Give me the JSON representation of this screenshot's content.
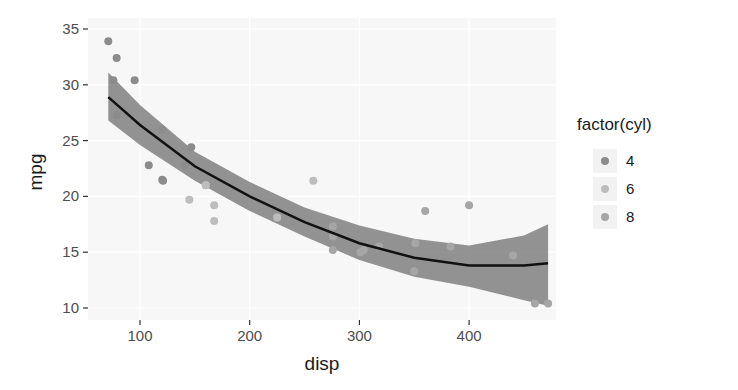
{
  "chart_data": {
    "type": "scatter",
    "title": "",
    "xlabel": "disp",
    "ylabel": "mpg",
    "xlim": [
      52,
      478
    ],
    "ylim": [
      9.1,
      35.5
    ],
    "x_ticks": [
      100,
      200,
      300,
      400
    ],
    "y_ticks": [
      10,
      15,
      20,
      25,
      30,
      35
    ],
    "grid": true,
    "legend": {
      "title": "factor(cyl)",
      "position": "right",
      "entries": [
        {
          "label": "4",
          "color": "#8c8c8c"
        },
        {
          "label": "6",
          "color": "#bdbdbd"
        },
        {
          "label": "8",
          "color": "#a6a6a6"
        }
      ]
    },
    "series": [
      {
        "name": "4",
        "color": "#8c8c8c",
        "points": [
          [
            71.1,
            33.9
          ],
          [
            78.7,
            32.4
          ],
          [
            75.7,
            30.4
          ],
          [
            95.1,
            30.4
          ],
          [
            108.0,
            22.8
          ],
          [
            120.3,
            21.5
          ],
          [
            140.8,
            22.8
          ],
          [
            146.7,
            24.4
          ],
          [
            79.0,
            27.3
          ],
          [
            120.1,
            26.0
          ],
          [
            121.0,
            21.4
          ]
        ]
      },
      {
        "name": "6",
        "color": "#bdbdbd",
        "points": [
          [
            145.0,
            19.7
          ],
          [
            160.0,
            21.0
          ],
          [
            167.6,
            19.2
          ],
          [
            167.6,
            17.8
          ],
          [
            225.0,
            18.1
          ],
          [
            258.0,
            21.4
          ],
          [
            160.0,
            21.0
          ]
        ]
      },
      {
        "name": "8",
        "color": "#a6a6a6",
        "points": [
          [
            360.0,
            18.7
          ],
          [
            400.0,
            19.2
          ],
          [
            351.0,
            15.8
          ],
          [
            304.0,
            15.2
          ],
          [
            318.0,
            15.5
          ],
          [
            350.0,
            13.3
          ],
          [
            440.0,
            14.7
          ],
          [
            460.0,
            10.4
          ],
          [
            472.0,
            10.4
          ],
          [
            301.0,
            15.0
          ],
          [
            275.8,
            16.4
          ],
          [
            275.8,
            17.3
          ],
          [
            275.8,
            15.2
          ],
          [
            383.0,
            15.5
          ]
        ]
      }
    ],
    "smooth": {
      "method": "loess",
      "color": "#111111",
      "band_color": "#808080",
      "x": [
        71.1,
        100,
        150,
        200,
        250,
        300,
        350,
        400,
        450,
        472
      ],
      "y": [
        28.9,
        26.4,
        22.7,
        20.0,
        17.7,
        15.8,
        14.5,
        13.8,
        13.8,
        14.0
      ],
      "lower": [
        26.8,
        24.6,
        21.4,
        18.7,
        16.4,
        14.3,
        12.8,
        11.9,
        10.7,
        10.2
      ],
      "upper": [
        31.1,
        28.2,
        24.0,
        21.3,
        19.0,
        17.4,
        16.2,
        15.6,
        16.5,
        17.5
      ]
    }
  }
}
